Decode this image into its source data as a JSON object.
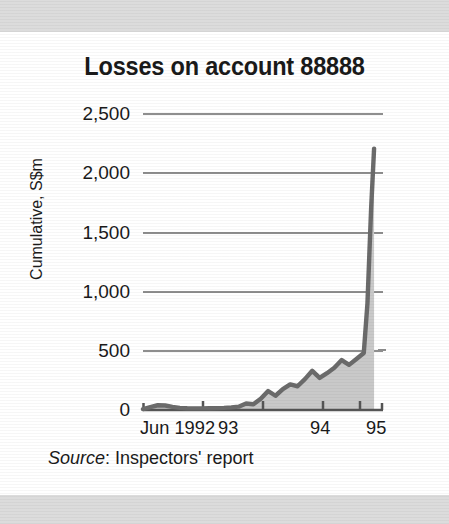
{
  "figure": {
    "title": "Losses on account 88888",
    "source_word": "Source",
    "source_rest": ": Inspectors' report"
  },
  "colors": {
    "page_background": "#ffffff",
    "scan_band": "#dcdcdc",
    "line": "#6b6b6b",
    "area_fill": "#c9c9c9",
    "gridline": "#8e8e8e",
    "axis": "#555555",
    "text": "#1a1a1a"
  },
  "chart_data": {
    "type": "area",
    "title": "Losses on account 88888",
    "subtitle": "",
    "xlabel": "",
    "ylabel": "Cumulative, S$m",
    "ylim": [
      0,
      2500
    ],
    "yticks": [
      0,
      500,
      1000,
      1500,
      2000,
      2500
    ],
    "ytick_labels": [
      "0",
      "500",
      "1,000",
      "1,500",
      "2,000",
      "2,500"
    ],
    "xtick_labels": [
      "Jun 1992",
      "93",
      "94",
      "95"
    ],
    "xtick_positions": [
      0,
      7,
      19,
      31
    ],
    "xlim": [
      0,
      32
    ],
    "grid": true,
    "legend": null,
    "units": "S$m",
    "series": [
      {
        "name": "Cumulative losses",
        "x": [
          0,
          1,
          2,
          3,
          4,
          5,
          6,
          7,
          8,
          9,
          10,
          11,
          12,
          13,
          14,
          15,
          16,
          17,
          18,
          19,
          20,
          21,
          22,
          23,
          24,
          25,
          26,
          27,
          28,
          29,
          30,
          30.5,
          31,
          31.4
        ],
        "values": [
          8,
          25,
          40,
          38,
          26,
          18,
          15,
          14,
          14,
          15,
          16,
          18,
          22,
          28,
          55,
          48,
          95,
          160,
          120,
          175,
          215,
          200,
          260,
          330,
          270,
          310,
          355,
          420,
          380,
          430,
          480,
          900,
          1700,
          2200
        ]
      }
    ],
    "annotations": [
      {
        "text": "Near-vertical spike at the right edge of the series, peaking at about 2,200",
        "x": 31.4,
        "y": 2200
      }
    ]
  }
}
